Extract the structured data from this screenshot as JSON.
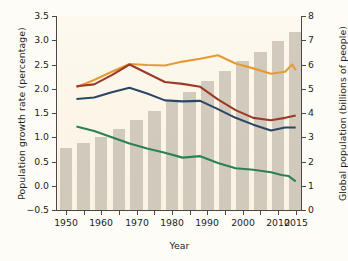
{
  "chart_data": {
    "type": "line",
    "title": "",
    "xlabel": "Year",
    "ylabel": "Population growth rate (percentage)",
    "ylabel_right": "Global population (billions of people)",
    "xlim": [
      1947.5,
      2016.5
    ],
    "ylim": [
      -0.5,
      3.5
    ],
    "ylim_right": [
      0,
      8
    ],
    "grid": false,
    "legend": "none",
    "xticks": [
      1950,
      1955,
      1960,
      1965,
      1970,
      1975,
      1980,
      1985,
      1990,
      1995,
      2000,
      2005,
      2010,
      2015
    ],
    "xtick_labels_shown": [
      1950,
      1960,
      1970,
      1980,
      1990,
      2000,
      2010,
      2015
    ],
    "yticks_left": [
      -0.5,
      0.0,
      0.5,
      1.0,
      1.5,
      2.0,
      2.5,
      3.0,
      3.5
    ],
    "ytick_labels_left": [
      "−0.5",
      "0.0",
      "0.5",
      "1.0",
      "1.5",
      "2.0",
      "2.5",
      "3.0",
      "3.5"
    ],
    "yticks_right": [
      0,
      1,
      2,
      3,
      4,
      5,
      6,
      7,
      8
    ],
    "ytick_labels_right": [
      "0",
      "1",
      "2",
      "3",
      "4",
      "5",
      "6",
      "7",
      "8"
    ],
    "bars": {
      "name": "Global population",
      "axis": "right",
      "color": "#cdc5b8",
      "x": [
        1950,
        1955,
        1960,
        1965,
        1970,
        1975,
        1980,
        1985,
        1990,
        1995,
        2000,
        2005,
        2010,
        2015
      ],
      "values": [
        2.54,
        2.77,
        3.03,
        3.34,
        3.7,
        4.08,
        4.46,
        4.87,
        5.33,
        5.75,
        6.14,
        6.52,
        6.96,
        7.35
      ]
    },
    "series": [
      {
        "name": "Orange series",
        "axis": "left",
        "color": "#e59b34",
        "x": [
          1953,
          1958,
          1963,
          1968,
          1973,
          1978,
          1983,
          1988,
          1993,
          1998,
          2003,
          2008,
          2012,
          2014,
          2015
        ],
        "values": [
          2.03,
          2.18,
          2.35,
          2.51,
          2.49,
          2.48,
          2.56,
          2.62,
          2.69,
          2.52,
          2.42,
          2.31,
          2.35,
          2.5,
          2.38
        ]
      },
      {
        "name": "Dark red series",
        "axis": "left",
        "color": "#9b3a26",
        "x": [
          1953,
          1958,
          1963,
          1968,
          1973,
          1978,
          1983,
          1988,
          1993,
          1998,
          2003,
          2008,
          2012,
          2015
        ],
        "values": [
          2.05,
          2.09,
          2.28,
          2.5,
          2.32,
          2.14,
          2.1,
          2.04,
          1.78,
          1.56,
          1.4,
          1.35,
          1.4,
          1.45
        ]
      },
      {
        "name": "Navy blue series",
        "axis": "left",
        "color": "#2c4666",
        "x": [
          1953,
          1958,
          1963,
          1968,
          1973,
          1978,
          1983,
          1988,
          1993,
          1998,
          2003,
          2008,
          2012,
          2015
        ],
        "values": [
          1.79,
          1.82,
          1.93,
          2.02,
          1.9,
          1.76,
          1.74,
          1.75,
          1.58,
          1.4,
          1.26,
          1.14,
          1.2,
          1.2
        ]
      },
      {
        "name": "Green series",
        "axis": "left",
        "color": "#2c8055",
        "x": [
          1953,
          1958,
          1963,
          1968,
          1973,
          1978,
          1983,
          1988,
          1993,
          1998,
          2003,
          2008,
          2011,
          2013,
          2015
        ],
        "values": [
          1.22,
          1.13,
          1.0,
          0.87,
          0.77,
          0.68,
          0.58,
          0.61,
          0.47,
          0.36,
          0.33,
          0.28,
          0.22,
          0.2,
          0.09
        ]
      }
    ]
  }
}
